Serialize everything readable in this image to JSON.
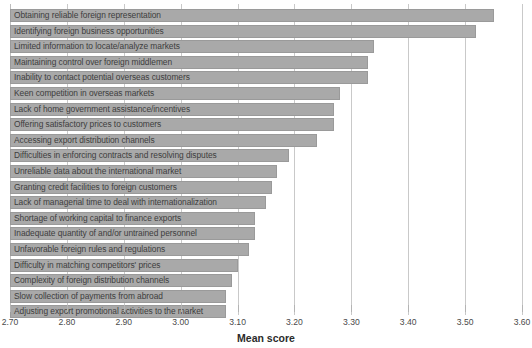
{
  "chart_data": {
    "type": "bar",
    "orientation": "horizontal",
    "title": "",
    "subtitle": "",
    "xlabel": "Mean score",
    "ylabel": "",
    "xlim": [
      2.7,
      3.6
    ],
    "xticks": [
      "2.70",
      "2.80",
      "2.90",
      "3.00",
      "3.10",
      "3.20",
      "3.30",
      "3.40",
      "3.50",
      "3.60"
    ],
    "xtick_values": [
      2.7,
      2.8,
      2.9,
      3.0,
      3.1,
      3.2,
      3.3,
      3.4,
      3.5,
      3.6
    ],
    "last_tick_clipped": true,
    "grid": "vertical",
    "legend": "none",
    "bar_color": "#a9a9a9",
    "bar_border_color": "#9a9a9a",
    "label_color": "#3d3d3d",
    "categories": [
      "Obtaining reliable foreign representation",
      "Identifying foreign business opportunities",
      "Limited information to locate/analyze markets",
      "Maintaining control over foreign middlemen",
      "Inability to contact potential overseas customers",
      "Keen competition in overseas markets",
      "Lack of home government assistance/incentives",
      "Offering satisfactory prices to customers",
      "Accessing export distribution channels",
      "Difficulties in enforcing contracts and resolving disputes",
      "Unreliable data about the international market",
      "Granting credit facilities to foreign customers",
      "Lack of managerial time to deal with internationalization",
      "Shortage of working capital to finance exports",
      "Inadequate quantity of and/or untrained personnel",
      "Unfavorable foreign rules and regulations",
      "Difficulty in matching competitors' prices",
      "Complexity of foreign distribution channels",
      "Slow collection of payments from abroad",
      "Adjusting export promotional activities to the market"
    ],
    "values": [
      3.55,
      3.52,
      3.34,
      3.33,
      3.33,
      3.28,
      3.27,
      3.27,
      3.24,
      3.19,
      3.17,
      3.16,
      3.15,
      3.13,
      3.13,
      3.12,
      3.1,
      3.09,
      3.08,
      3.08
    ]
  }
}
